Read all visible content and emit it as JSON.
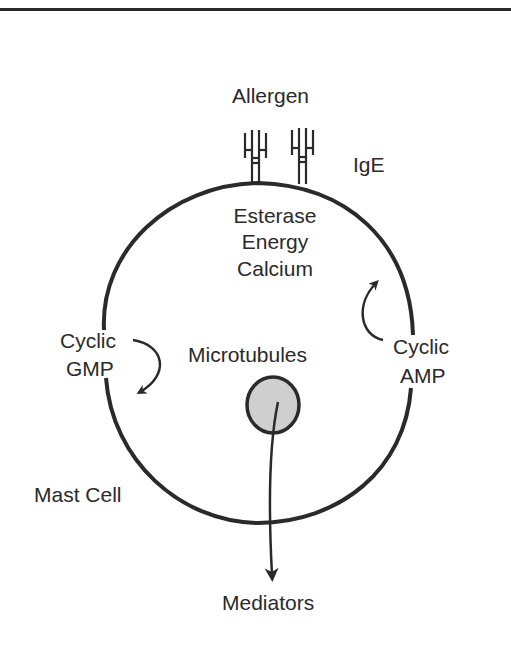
{
  "diagram": {
    "labels": {
      "allergen": "Allergen",
      "ige": "IgE",
      "esterase": "Esterase",
      "energy": "Energy",
      "calcium": "Calcium",
      "cyclic_gmp_line1": "Cyclic",
      "cyclic_gmp_line2": "GMP",
      "cyclic_amp_line1": "Cyclic",
      "cyclic_amp_line2": "AMP",
      "microtubules": "Microtubules",
      "mast_cell": "Mast Cell",
      "mediators": "Mediators"
    },
    "colors": {
      "ink": "#2a2a2a",
      "granule_fill": "#cfcfcf",
      "background": "#ffffff"
    }
  }
}
